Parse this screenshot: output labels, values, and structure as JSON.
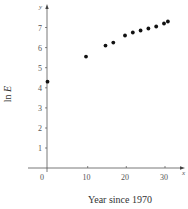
{
  "chart_data": {
    "type": "scatter",
    "title": "",
    "xlabel": "Year since 1970",
    "ylabel": "ln E",
    "x_axis_letter": "x",
    "y_axis_letter": "y",
    "xlim": [
      0,
      32
    ],
    "ylim": [
      0,
      8
    ],
    "xticks": [
      0,
      10,
      20,
      30
    ],
    "yticks": [
      1,
      2,
      3,
      4,
      5,
      6,
      7
    ],
    "grid": false,
    "legend": null,
    "points": [
      {
        "x": 0,
        "y": 4.3
      },
      {
        "x": 10,
        "y": 5.55
      },
      {
        "x": 15,
        "y": 6.1
      },
      {
        "x": 17,
        "y": 6.25
      },
      {
        "x": 20,
        "y": 6.6
      },
      {
        "x": 22,
        "y": 6.75
      },
      {
        "x": 24,
        "y": 6.85
      },
      {
        "x": 26,
        "y": 6.95
      },
      {
        "x": 28,
        "y": 7.05
      },
      {
        "x": 30,
        "y": 7.2
      },
      {
        "x": 31,
        "y": 7.3
      }
    ],
    "marker_color": "#111111"
  },
  "labels": {
    "xlabel": "Year since 1970",
    "ylabel_prefix": "ln ",
    "ylabel_var": "E",
    "x_letter": "x",
    "y_letter": "y",
    "xtick_0": "0",
    "xtick_10": "10",
    "xtick_20": "20",
    "xtick_30": "30",
    "ytick_1": "1",
    "ytick_2": "2",
    "ytick_3": "3",
    "ytick_4": "4",
    "ytick_5": "5",
    "ytick_6": "6",
    "ytick_7": "7"
  }
}
